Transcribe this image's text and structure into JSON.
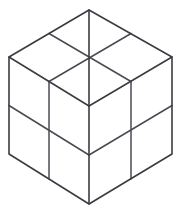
{
  "figure": {
    "background_color": "#ffffff",
    "line_color": "#3b3b42",
    "line_width": 1.6,
    "canvas": {
      "width": 181,
      "height": 212
    },
    "projection": "isometric",
    "subdivisions_per_face": 2,
    "visible_faces": 3,
    "visible_cells_total": 12,
    "vertices": {
      "top_apex": [
        89,
        10
      ],
      "top_left": [
        9,
        57
      ],
      "top_right": [
        172,
        57
      ],
      "center": [
        89,
        106
      ],
      "bottom_left": [
        9,
        154
      ],
      "bottom_right": [
        172,
        154
      ],
      "bottom_apex": [
        89,
        204
      ]
    },
    "edge_midpoints": {
      "top_upper_left": [
        49,
        33.5
      ],
      "top_upper_right": [
        131,
        33.5
      ],
      "top_lower_left": [
        49,
        81.5
      ],
      "top_lower_right": [
        131,
        81.5
      ],
      "left_side": [
        9,
        105.5
      ],
      "right_side": [
        172,
        105.5
      ],
      "bottom_left_side": [
        49,
        179
      ],
      "bottom_right_side": [
        131,
        179
      ],
      "center_vertical": [
        89,
        155
      ]
    },
    "faces": [
      {
        "name": "top-face",
        "label": "Top face",
        "outline": "89,10 172,57 89,106 9,57",
        "cells": [
          {
            "name": "top-cell-back-left",
            "points": "89,10 131,33.5 89,57 49,33.5"
          },
          {
            "name": "top-cell-back-right",
            "points": "131,33.5 172,57 131,81.5 89,57"
          },
          {
            "name": "top-cell-front-left",
            "points": "49,33.5 89,57 49,81.5 9,57"
          },
          {
            "name": "top-cell-front-right",
            "points": "89,57 131,81.5 89,106 49,81.5"
          }
        ]
      },
      {
        "name": "left-face",
        "label": "Left face",
        "outline": "9,57 89,106 89,204 9,154",
        "cells": [
          {
            "name": "left-cell-top-left",
            "points": "9,57 49,81.5 49,179 9,154"
          },
          {
            "name": "left-cell-top-right",
            "points": "49,81.5 89,106 89,204 49,179"
          }
        ]
      },
      {
        "name": "right-face",
        "label": "Right face",
        "outline": "89,106 172,57 172,154 89,204",
        "cells": [
          {
            "name": "right-cell-top-left",
            "points": "89,106 131,81.5 131,179 89,204"
          },
          {
            "name": "right-cell-top-right",
            "points": "131,81.5 172,57 172,154 131,179"
          }
        ]
      }
    ],
    "outer_outline": "89,10 172,57 172,154 89,204 9,154 9,57 89,10",
    "interior_lines": [
      {
        "name": "center-spoke-to-top-apex",
        "d": "M 89 106 L 89 10"
      },
      {
        "name": "center-spoke-to-left-vertex",
        "d": "M 89 106 L 9 57"
      },
      {
        "name": "center-spoke-to-right-vertex",
        "d": "M 89 106 L 172 57"
      },
      {
        "name": "center-spoke-to-bottom-apex",
        "d": "M 89 106 L 89 204"
      },
      {
        "name": "top-face-divider-left",
        "d": "M 49 33.5 L 131 81.5"
      },
      {
        "name": "top-face-divider-right",
        "d": "M 131 33.5 L 49 81.5"
      },
      {
        "name": "left-face-vertical-divider",
        "d": "M 49 81.5 L 49 179"
      },
      {
        "name": "right-face-vertical-divider",
        "d": "M 131 81.5 L 131 179"
      },
      {
        "name": "left-face-horizontal-divider",
        "d": "M 9 105.5 L 89 155"
      },
      {
        "name": "right-face-horizontal-divider",
        "d": "M 172 105.5 L 89 155"
      }
    ]
  }
}
